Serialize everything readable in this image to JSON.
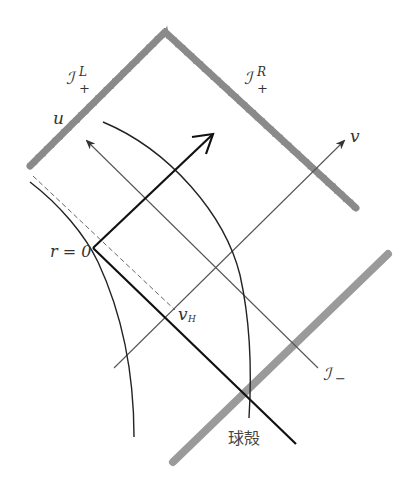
{
  "diagram": {
    "type": "penrose-diagram",
    "labels": {
      "scri_plus_left": {
        "symbol": "ℐ",
        "sup": "L",
        "sub": "+"
      },
      "scri_plus_right": {
        "symbol": "ℐ",
        "sup": "R",
        "sub": "+"
      },
      "scri_minus": {
        "symbol": "ℐ",
        "sub": "−"
      },
      "u_axis": "u",
      "v_axis": "v",
      "r_zero": "r = 0",
      "v_horizon": {
        "symbol": "v",
        "sub": "H"
      },
      "shell": "球殻"
    },
    "colors": {
      "wavy_boundary": "#8a8a8a",
      "gray_bar": "#9a9a9a",
      "lines": "#1a1a1a",
      "thin_lines": "#444444"
    },
    "elements": [
      {
        "name": "scri-plus-left",
        "style": "wavy",
        "from": [
          30,
          166
        ],
        "to": [
          165,
          32
        ]
      },
      {
        "name": "scri-plus-right",
        "style": "wavy",
        "from": [
          165,
          32
        ],
        "to": [
          356,
          208
        ]
      },
      {
        "name": "scri-minus-bar",
        "style": "thick-gray",
        "from": [
          173,
          462
        ],
        "to": [
          388,
          254
        ]
      },
      {
        "name": "u-axis",
        "style": "thin-arrow",
        "from": [
          318,
          368
        ],
        "to": [
          86,
          140
        ]
      },
      {
        "name": "v-axis",
        "style": "thin-arrow",
        "from": [
          114,
          368
        ],
        "to": [
          345,
          140
        ]
      },
      {
        "name": "outgoing-arrow",
        "style": "thick-arrow",
        "from": [
          93,
          248
        ],
        "to": [
          213,
          134
        ]
      },
      {
        "name": "shell-line",
        "style": "thick",
        "from": [
          93,
          248
        ],
        "to": [
          296,
          444
        ]
      },
      {
        "name": "horizon-dashed",
        "style": "dashed",
        "from": [
          33,
          176
        ],
        "to": [
          175,
          310
        ]
      },
      {
        "name": "r-zero-curve",
        "style": "curve"
      },
      {
        "name": "shell-worldline-arc",
        "style": "curve"
      }
    ]
  }
}
